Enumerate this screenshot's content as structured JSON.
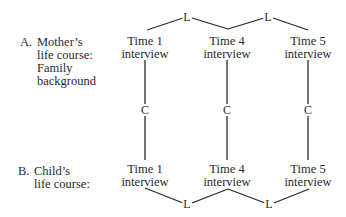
{
  "sections": {
    "a": {
      "marker": "A.",
      "lines": [
        "Mother’s",
        "life course:",
        "Family",
        "background"
      ]
    },
    "b": {
      "marker": "B.",
      "lines": [
        "Child’s",
        "life course:"
      ]
    }
  },
  "mother_nodes": [
    {
      "line1": "Time 1",
      "line2": "interview"
    },
    {
      "line1": "Time 4",
      "line2": "interview"
    },
    {
      "line1": "Time 5",
      "line2": "interview"
    }
  ],
  "child_nodes": [
    {
      "line1": "Time 1",
      "line2": "interview"
    },
    {
      "line1": "Time 4",
      "line2": "interview"
    },
    {
      "line1": "Time 5",
      "line2": "interview"
    }
  ],
  "links": {
    "longitudinal_label": "L",
    "cross_label": "C"
  },
  "colors": {
    "line": "#2a2a2a",
    "text": "#2a2a2a"
  }
}
